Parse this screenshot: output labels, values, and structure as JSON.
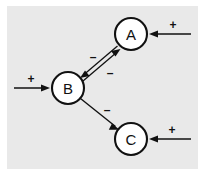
{
  "figure": {
    "background_color": "#ffffff",
    "panel_color": "#e9e9e9",
    "ink_color": "#111111"
  },
  "nodes": [
    {
      "id": "A",
      "label": "A",
      "cx": 131,
      "cy": 34,
      "r": 16
    },
    {
      "id": "B",
      "label": "B",
      "cx": 68,
      "cy": 88,
      "r": 16
    },
    {
      "id": "C",
      "label": "C",
      "cx": 131,
      "cy": 139,
      "r": 16
    }
  ],
  "edges": [
    {
      "id": "input-a",
      "from": "external",
      "to": "A",
      "sign": "+",
      "sign_label": "+",
      "direction": "right-to-left"
    },
    {
      "id": "input-b",
      "from": "external",
      "to": "B",
      "sign": "+",
      "sign_label": "+",
      "direction": "left-to-right"
    },
    {
      "id": "input-c",
      "from": "external",
      "to": "C",
      "sign": "+",
      "sign_label": "+",
      "direction": "right-to-left"
    },
    {
      "id": "a-to-b",
      "from": "A",
      "to": "B",
      "sign": "-",
      "sign_label": "–",
      "direction": "upper-right-to-lower-left"
    },
    {
      "id": "b-to-a",
      "from": "B",
      "to": "A",
      "sign": "-",
      "sign_label": "–",
      "direction": "lower-left-to-upper-right"
    },
    {
      "id": "b-to-c",
      "from": "B",
      "to": "C",
      "sign": "-",
      "sign_label": "–",
      "direction": "upper-left-to-lower-right"
    }
  ],
  "labels": {
    "node_a": "A",
    "node_b": "B",
    "node_c": "C",
    "plus_a": "+",
    "plus_b": "+",
    "plus_c": "+",
    "minus_a_to_b": "–",
    "minus_b_to_a": "–",
    "minus_b_to_c": "–"
  }
}
